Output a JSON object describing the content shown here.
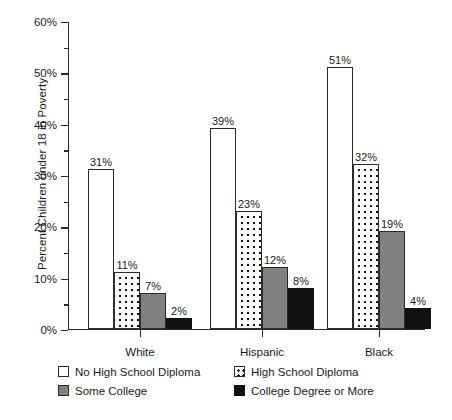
{
  "chart_data": {
    "type": "bar",
    "title": "",
    "subtitle": "",
    "xlabel": "",
    "ylabel": "Percent Children under 18 in Poverty",
    "categories": [
      "White",
      "Hispanic",
      "Black"
    ],
    "series": [
      {
        "name": "No High School Diploma",
        "style": "open",
        "values": [
          31,
          39,
          51
        ],
        "labels": [
          "31%",
          "39%",
          "51%"
        ]
      },
      {
        "name": "High School Diploma",
        "style": "dotted",
        "values": [
          11,
          23,
          32
        ],
        "labels": [
          "11%",
          "23%",
          "32%"
        ]
      },
      {
        "name": "Some College",
        "style": "gray",
        "values": [
          7,
          12,
          19
        ],
        "labels": [
          "7%",
          "12%",
          "19%"
        ]
      },
      {
        "name": "College Degree or More",
        "style": "black",
        "values": [
          2,
          8,
          4
        ],
        "labels": [
          "2%",
          "8%",
          "4%"
        ]
      }
    ],
    "ylim": [
      0,
      60
    ],
    "y_major_ticks": [
      0,
      10,
      20,
      30,
      40,
      50,
      60
    ],
    "y_major_tick_labels": [
      "0%",
      "10%",
      "20%",
      "30%",
      "40%",
      "50%",
      "60%"
    ],
    "y_minor_ticks": [
      5,
      15,
      25,
      35,
      45,
      55
    ],
    "grid": false,
    "legend_position": "below-axis",
    "colors": {
      "open_fill": "#ffffff",
      "dotted_fill": "#ffffff",
      "dot_color": "#111111",
      "gray_fill": "#808080",
      "black_fill": "#111111",
      "outline": "#2b2b2b",
      "text": "#1a1a1a",
      "background": "#ffffff"
    }
  },
  "legend": {
    "entries": [
      {
        "label": "No High School Diploma",
        "style": "open"
      },
      {
        "label": "High School Diploma",
        "style": "dotted"
      },
      {
        "label": "Some College",
        "style": "gray"
      },
      {
        "label": "College Degree or More",
        "style": "black"
      }
    ]
  }
}
